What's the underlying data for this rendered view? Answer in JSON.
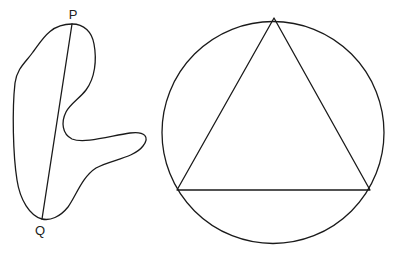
{
  "figure_left": {
    "shape": "irregular-closed-curve",
    "chord": {
      "from": "P",
      "to": "Q"
    },
    "points": {
      "P": {
        "label": "P",
        "x": 72,
        "y": 24,
        "label_x": 73,
        "label_y": 19
      },
      "Q": {
        "label": "Q",
        "x": 42,
        "y": 219,
        "label_x": 40,
        "label_y": 235
      }
    }
  },
  "figure_right": {
    "shape": "circle-with-inscribed-equilateral-triangle",
    "circle": {
      "cx": 273,
      "cy": 132.5,
      "r": 111
    },
    "triangle": {
      "vertices": [
        {
          "x": 274,
          "y": 18
        },
        {
          "x": 177,
          "y": 190
        },
        {
          "x": 370,
          "y": 190
        }
      ]
    }
  },
  "colors": {
    "stroke": "#1a1a1a",
    "background": "#ffffff",
    "text": "#222222"
  }
}
